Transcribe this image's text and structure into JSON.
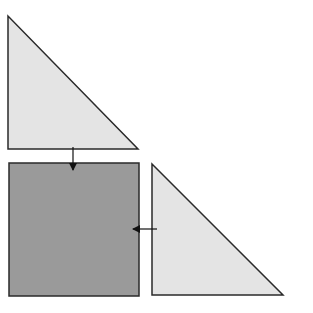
{
  "diagram": {
    "colors": {
      "triangle_fill": "#e4e4e4",
      "square_fill": "#9a9a9a",
      "stroke": "#2a2a2a",
      "background": "#ffffff"
    },
    "shapes": [
      {
        "id": "triangle-top",
        "type": "right-triangle",
        "points": [
          [
            8,
            16
          ],
          [
            8,
            149
          ],
          [
            138,
            149
          ]
        ]
      },
      {
        "id": "square",
        "type": "square",
        "x": 9,
        "y": 163,
        "width": 130,
        "height": 133
      },
      {
        "id": "triangle-right",
        "type": "right-triangle",
        "points": [
          [
            152,
            164
          ],
          [
            152,
            295
          ],
          [
            283,
            295
          ]
        ]
      }
    ],
    "arrows": [
      {
        "id": "arrow-down",
        "from": [
          73,
          147
        ],
        "to": [
          73,
          170
        ],
        "direction": "down"
      },
      {
        "id": "arrow-left",
        "from": [
          157,
          229
        ],
        "to": [
          133,
          229
        ],
        "direction": "left"
      }
    ]
  }
}
